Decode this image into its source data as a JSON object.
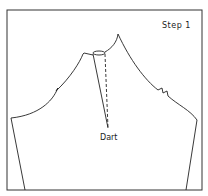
{
  "diagram": {
    "step_label": "Step 1",
    "dart_label": "Dart",
    "colors": {
      "line": "#222222",
      "frame": "#333333",
      "background": "#ffffff"
    }
  }
}
